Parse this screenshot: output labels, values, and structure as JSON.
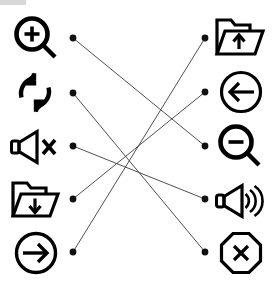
{
  "diagram": {
    "type": "matching-puzzle",
    "width": 278,
    "height": 288,
    "background_color": "#ffffff",
    "line_color": "#3b3b3b",
    "dot_color": "#111111",
    "icon_color": "#000000",
    "left_column": [
      {
        "id": "zoom-in",
        "icon": "magnifier-plus-icon",
        "label": "Zoom in",
        "y": 38
      },
      {
        "id": "refresh",
        "icon": "refresh-circular-arrows-icon",
        "label": "Refresh",
        "y": 93
      },
      {
        "id": "mute",
        "icon": "speaker-mute-icon",
        "label": "Mute",
        "y": 146
      },
      {
        "id": "folder-down",
        "icon": "folder-download-icon",
        "label": "Download to folder",
        "y": 199
      },
      {
        "id": "arrow-right",
        "icon": "arrow-right-circle-icon",
        "label": "Sign in",
        "y": 252
      }
    ],
    "right_column": [
      {
        "id": "folder-up",
        "icon": "folder-upload-icon",
        "label": "Upload from folder",
        "y": 38
      },
      {
        "id": "arrow-left",
        "icon": "arrow-left-circle-icon",
        "label": "Sign out",
        "y": 92
      },
      {
        "id": "zoom-out",
        "icon": "magnifier-minus-icon",
        "label": "Zoom out",
        "y": 146
      },
      {
        "id": "volume-on",
        "icon": "speaker-waves-icon",
        "label": "Volume on",
        "y": 199
      },
      {
        "id": "stop",
        "icon": "octagon-x-icon",
        "label": "Stop",
        "y": 252
      }
    ],
    "left_dot_x": 73,
    "right_dot_x": 205,
    "dot_radius": 3.4,
    "connections": [
      {
        "from": "zoom-in",
        "to": "zoom-out",
        "from_y": 38,
        "to_y": 146
      },
      {
        "from": "refresh",
        "to": "stop",
        "from_y": 93,
        "to_y": 252
      },
      {
        "from": "mute",
        "to": "volume-on",
        "from_y": 146,
        "to_y": 199
      },
      {
        "from": "folder-down",
        "to": "arrow-left",
        "from_y": 199,
        "to_y": 92
      },
      {
        "from": "arrow-right",
        "to": "folder-up",
        "from_y": 252,
        "to_y": 38
      }
    ]
  }
}
